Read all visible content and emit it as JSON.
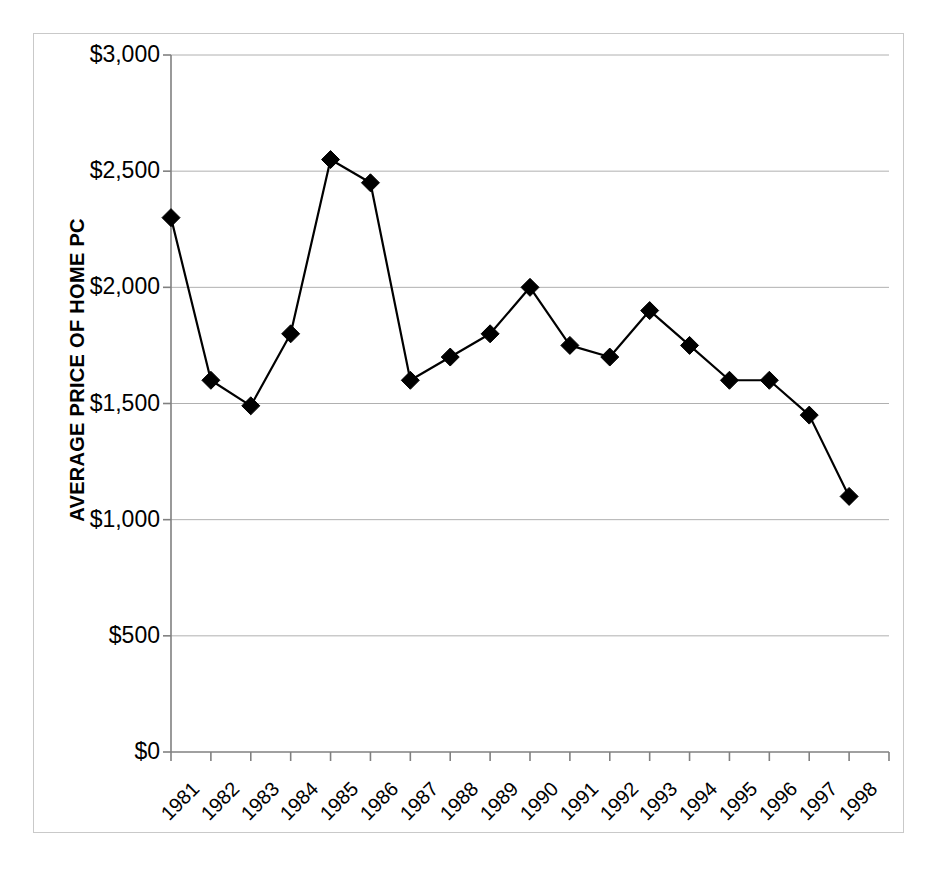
{
  "chart_data": {
    "type": "line",
    "title": "",
    "xlabel": "",
    "ylabel": "AVERAGE PRICE OF HOME PC",
    "ylim": [
      0,
      3000
    ],
    "ytick_values": [
      0,
      500,
      1000,
      1500,
      2000,
      2500,
      3000
    ],
    "ytick_labels": [
      "$0",
      "$500",
      "$1,000",
      "$1,500",
      "$2,000",
      "$2,500",
      "$3,000"
    ],
    "categories": [
      "1981",
      "1982",
      "1983",
      "1984",
      "1985",
      "1986",
      "1987",
      "1988",
      "1989",
      "1990",
      "1991",
      "1992",
      "1993",
      "1994",
      "1995",
      "1996",
      "1997",
      "1998"
    ],
    "values": [
      2300,
      1600,
      1490,
      1800,
      2550,
      2450,
      1600,
      1700,
      1800,
      2000,
      1750,
      1700,
      1900,
      1750,
      1600,
      1600,
      1450,
      1100
    ],
    "grid": "horizontal",
    "legend": "none",
    "marker": "diamond",
    "series_color": "#000000",
    "gridline_color": "#b0b0b0",
    "axis_color": "#808080",
    "frame_color": "#c9c9c9",
    "marker_size": 9,
    "line_width": 2.2
  }
}
